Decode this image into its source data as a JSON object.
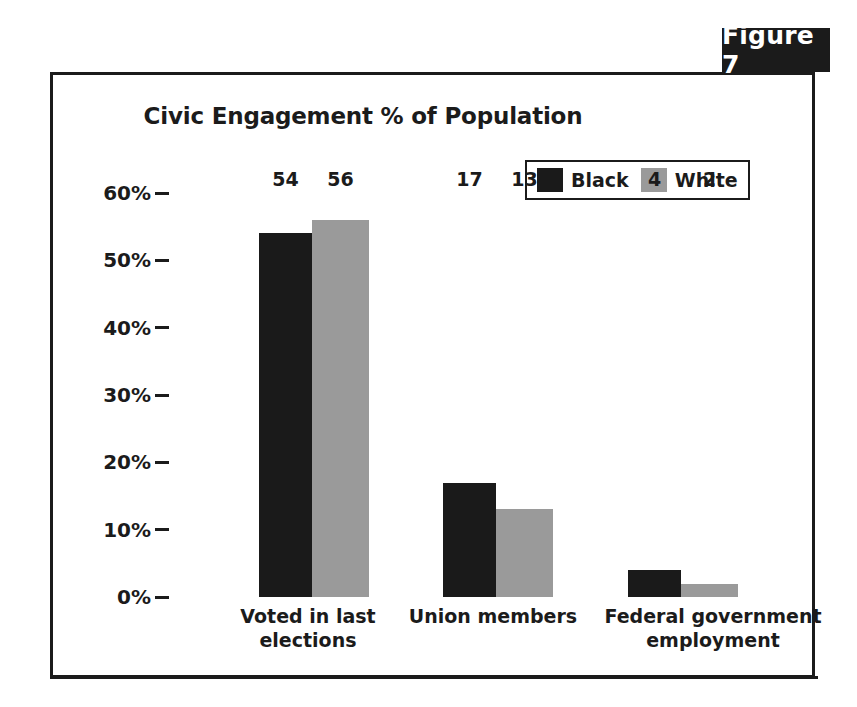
{
  "figure": {
    "badge_label": "Figure 7"
  },
  "chart_data": {
    "type": "bar",
    "title": "Civic Engagement % of Population",
    "xlabel": "",
    "ylabel": "",
    "ylim": [
      0,
      60
    ],
    "grid": false,
    "legend_position": "top-right",
    "ytick_labels": [
      "60%",
      "50%",
      "40%",
      "30%",
      "20%",
      "10%",
      "0%"
    ],
    "ytick_values": [
      60,
      50,
      40,
      30,
      20,
      10,
      0
    ],
    "categories": [
      "Voted in last elections",
      "Union members",
      "Federal government employment"
    ],
    "category_lines": [
      [
        "Voted in last",
        "elections"
      ],
      [
        "Union members",
        ""
      ],
      [
        "Federal government",
        "employment"
      ]
    ],
    "series": [
      {
        "name": "Black",
        "color": "#1a1a1a",
        "values": [
          54,
          17,
          4
        ]
      },
      {
        "name": "White",
        "color": "#9a9a9a",
        "values": [
          56,
          13,
          2
        ]
      }
    ]
  },
  "colors": {
    "frame": "#1b1b1b",
    "badge_background": "#1b1b1b",
    "badge_text": "#ffffff",
    "black_series": "#1a1a1a",
    "white_series": "#9a9a9a",
    "text": "#1b1b1b",
    "background": "#ffffff"
  }
}
